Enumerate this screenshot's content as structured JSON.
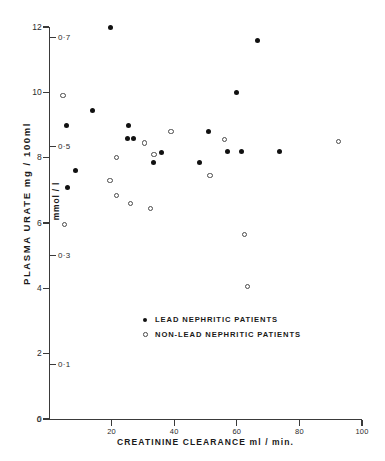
{
  "figure": {
    "corner_mark": "",
    "legend": {
      "position": "inside-bottom-center",
      "entries": [
        {
          "marker": "filled-circle",
          "label": "LEAD  NEPHRITIC  PATIENTS"
        },
        {
          "marker": "open-circle",
          "label": "NON-LEAD  NEPHRITIC  PATIENTS"
        }
      ]
    }
  },
  "chart_data": {
    "type": "scatter",
    "title": "",
    "xlabel": "CREATININE   CLEARANCE  ml / min.",
    "ylabel": "PLASMA  URATE   mg / 100ml",
    "ylabel_secondary": "mmol / l",
    "xlim": [
      0,
      100
    ],
    "ylim": [
      0,
      12
    ],
    "ylim_secondary": [
      0,
      0.72
    ],
    "grid": false,
    "xticks": [
      0,
      20,
      40,
      60,
      80,
      100
    ],
    "xticklabels": [
      "0",
      "20",
      "40",
      "60",
      "80",
      "100"
    ],
    "yticks": [
      0,
      2,
      4,
      6,
      8,
      10,
      12
    ],
    "yticklabels": [
      "0",
      "2",
      "4",
      "6",
      "8",
      "10",
      "12"
    ],
    "yticks_secondary": [
      0.1,
      0.3,
      0.5,
      0.7
    ],
    "yticklabels_secondary": [
      "0·1",
      "0·3",
      "0·5",
      "0·7"
    ],
    "series": [
      {
        "name": "LEAD  NEPHRITIC  PATIENTS",
        "marker": "filled-circle",
        "color": "#111111",
        "points": [
          {
            "x": 19.5,
            "y": 12.0
          },
          {
            "x": 66.5,
            "y": 11.6
          },
          {
            "x": 14.0,
            "y": 9.45
          },
          {
            "x": 60.0,
            "y": 10.0
          },
          {
            "x": 5.5,
            "y": 9.0
          },
          {
            "x": 25.5,
            "y": 9.0
          },
          {
            "x": 25.0,
            "y": 8.6
          },
          {
            "x": 27.0,
            "y": 8.6
          },
          {
            "x": 51.0,
            "y": 8.8
          },
          {
            "x": 57.0,
            "y": 8.2
          },
          {
            "x": 61.5,
            "y": 8.2
          },
          {
            "x": 73.5,
            "y": 8.2
          },
          {
            "x": 36.0,
            "y": 8.15
          },
          {
            "x": 33.5,
            "y": 7.85
          },
          {
            "x": 48.0,
            "y": 7.85
          },
          {
            "x": 8.5,
            "y": 7.6
          },
          {
            "x": 6.0,
            "y": 7.1
          }
        ]
      },
      {
        "name": "NON-LEAD  NEPHRITIC  PATIENTS",
        "marker": "open-circle",
        "color": "#4a4a4a",
        "points": [
          {
            "x": 4.5,
            "y": 9.9
          },
          {
            "x": 39.0,
            "y": 8.8
          },
          {
            "x": 92.5,
            "y": 8.5
          },
          {
            "x": 56.0,
            "y": 8.55
          },
          {
            "x": 30.5,
            "y": 8.45
          },
          {
            "x": 21.5,
            "y": 8.0
          },
          {
            "x": 33.5,
            "y": 8.1
          },
          {
            "x": 51.5,
            "y": 7.45
          },
          {
            "x": 19.5,
            "y": 7.3
          },
          {
            "x": 21.5,
            "y": 6.85
          },
          {
            "x": 26.0,
            "y": 6.6
          },
          {
            "x": 32.5,
            "y": 6.45
          },
          {
            "x": 5.0,
            "y": 5.95
          },
          {
            "x": 62.5,
            "y": 5.65
          },
          {
            "x": 63.5,
            "y": 4.05
          }
        ]
      }
    ]
  }
}
